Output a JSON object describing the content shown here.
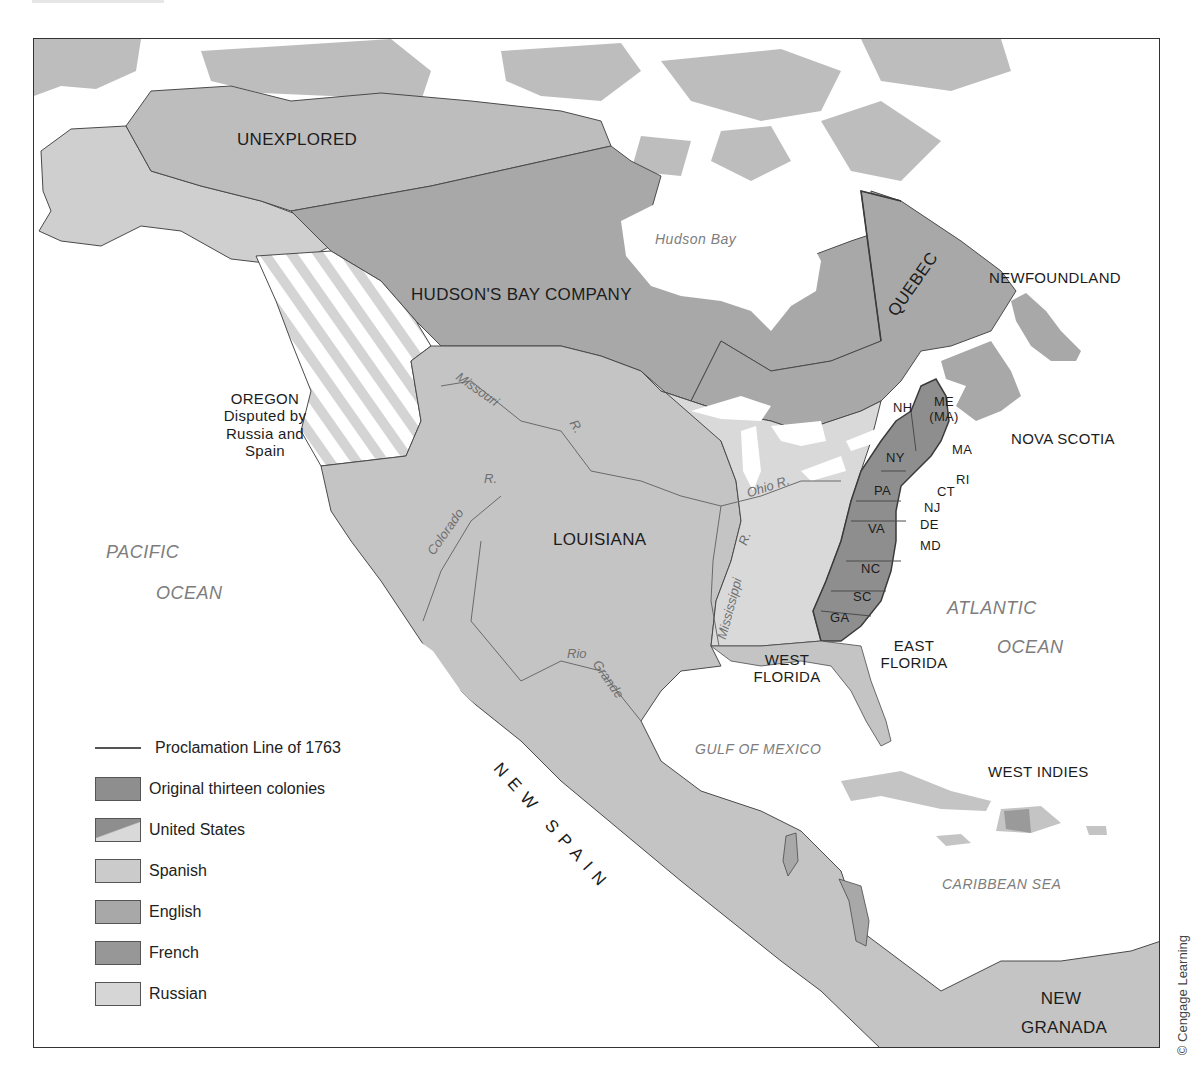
{
  "colors": {
    "original_colonies": "#8e8e8e",
    "united_states": "#d9d9d9",
    "spanish": "#c4c4c4",
    "english": "#a8a8a8",
    "french": "#9a9a9a",
    "russian": "#cfcfcf",
    "unexplored": "#bdbdbd",
    "water": "#ffffff",
    "border": "#4a4a4a"
  },
  "regions": {
    "unexplored": "UNEXPLORED",
    "hudsons_bay_company": "HUDSON'S BAY COMPANY",
    "quebec": "QUEBEC",
    "newfoundland": "NEWFOUNDLAND",
    "nova_scotia": "NOVA SCOTIA",
    "oregon": "OREGON",
    "oregon_note_1": "Disputed by",
    "oregon_note_2": "Russia and",
    "oregon_note_3": "Spain",
    "louisiana": "LOUISIANA",
    "new_spain": "NEW SPAIN",
    "west_florida_1": "WEST",
    "west_florida_2": "FLORIDA",
    "east_florida_1": "EAST",
    "east_florida_2": "FLORIDA",
    "west_indies": "WEST INDIES",
    "new_granada_1": "NEW",
    "new_granada_2": "GRANADA"
  },
  "colonies": {
    "nh": "NH",
    "me": "ME",
    "me_sub": "(MA)",
    "ny": "NY",
    "ma": "MA",
    "ri": "RI",
    "ct": "CT",
    "pa": "PA",
    "nj": "NJ",
    "de": "DE",
    "md": "MD",
    "va": "VA",
    "nc": "NC",
    "sc": "SC",
    "ga": "GA"
  },
  "water_bodies": {
    "hudson_bay": "Hudson  Bay",
    "pacific_1": "PACIFIC",
    "pacific_2": "OCEAN",
    "atlantic_1": "ATLANTIC",
    "atlantic_2": "OCEAN",
    "gulf": "GULF OF MEXICO",
    "caribbean": "CARIBBEAN SEA"
  },
  "rivers": {
    "missouri": "Missouri",
    "missouri_r": "R.",
    "colorado": "Colorado",
    "colorado_r": "R.",
    "ohio": "Ohio R.",
    "mississippi": "Mississippi",
    "mississippi_r": "R.",
    "rio": "Rio",
    "grande": "Grande"
  },
  "legend": {
    "items": [
      {
        "label": "Proclamation Line of 1763",
        "kind": "line"
      },
      {
        "label": "Original thirteen colonies",
        "kind": "original_colonies"
      },
      {
        "label": "United States",
        "kind": "united_states"
      },
      {
        "label": "Spanish",
        "kind": "spanish"
      },
      {
        "label": "English",
        "kind": "english"
      },
      {
        "label": "French",
        "kind": "french"
      },
      {
        "label": "Russian",
        "kind": "russian"
      }
    ]
  },
  "credit": "© Cengage Learning"
}
